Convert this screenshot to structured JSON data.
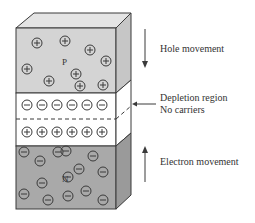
{
  "diagram": {
    "regions": {
      "p": {
        "label": "P",
        "carrier": "hole",
        "sign": "+"
      },
      "depletion": {
        "label": "Depletion region",
        "sublabel": "No carriers"
      },
      "n": {
        "label": "N",
        "carrier": "electron",
        "sign": "-"
      }
    },
    "annotations": {
      "hole_movement": "Hole movement",
      "depletion_line1": "Depletion region",
      "depletion_line2": "No carriers",
      "electron_movement": "Electron movement"
    },
    "p_holes_count": 9,
    "depletion_negative_ions": 6,
    "depletion_positive_ions": 6,
    "n_electrons_count": 14,
    "colors": {
      "p_face": "#d4d4d4",
      "p_top": "#e4e4e4",
      "p_side": "#c6c6c6",
      "depletion_face": "#ffffff",
      "n_face": "#a9a9a9",
      "n_side": "#9a9a9a",
      "stroke": "#3a3a3a"
    }
  }
}
